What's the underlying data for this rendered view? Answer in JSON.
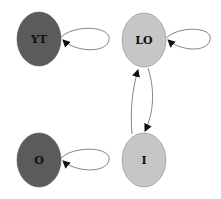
{
  "diagram": {
    "type": "state-transition-graph",
    "nodes": [
      {
        "id": "YT",
        "label": "YT",
        "cx": 39,
        "cy": 39,
        "rx": 22,
        "ry": 27,
        "fill": "#5b5b5b",
        "text": "#111111"
      },
      {
        "id": "LO",
        "label": "LO",
        "cx": 144,
        "cy": 40,
        "rx": 22,
        "ry": 27,
        "fill": "#c6c6c6",
        "text": "#111111"
      },
      {
        "id": "O",
        "label": "O",
        "cx": 39,
        "cy": 160,
        "rx": 22,
        "ry": 27,
        "fill": "#5b5b5b",
        "text": "#111111"
      },
      {
        "id": "I",
        "label": "I",
        "cx": 144,
        "cy": 160,
        "rx": 22,
        "ry": 27,
        "fill": "#c6c6c6",
        "text": "#111111"
      }
    ],
    "edges": [
      {
        "from": "YT",
        "to": "YT",
        "kind": "self-loop"
      },
      {
        "from": "LO",
        "to": "LO",
        "kind": "self-loop"
      },
      {
        "from": "O",
        "to": "O",
        "kind": "self-loop"
      },
      {
        "from": "I",
        "to": "LO",
        "kind": "arc"
      },
      {
        "from": "LO",
        "to": "I",
        "kind": "arc"
      }
    ],
    "edge_color": "#555555"
  }
}
